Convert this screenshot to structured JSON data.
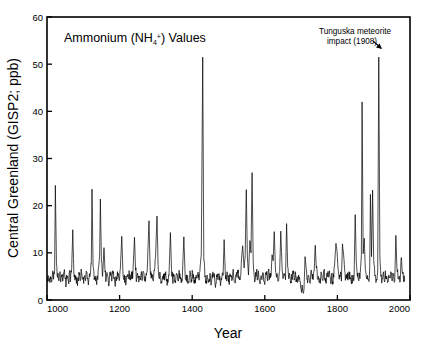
{
  "figure": {
    "background": "#ffffff",
    "line_color": "#000000"
  },
  "chart_data": {
    "type": "line",
    "title": "Ammonium (NH4+) Values",
    "title_parts": {
      "lead": "Ammonium (NH",
      "sub": "4",
      "sup": "+",
      "tail": ") Values"
    },
    "xlabel": "Year",
    "ylabel": "Central Greenland (GISP2; ppb)",
    "xlim": [
      1000,
      2000
    ],
    "ylim": [
      0,
      60
    ],
    "xticks": [
      1000,
      1200,
      1400,
      1600,
      1800,
      2000
    ],
    "xticklabels": [
      "1000",
      "1200",
      "1400",
      "1600",
      "1800",
      "2000"
    ],
    "yticks": [
      0,
      10,
      20,
      30,
      40,
      50,
      60
    ],
    "yticklabels": [
      "0",
      "10",
      "20",
      "30",
      "40",
      "50",
      "60"
    ],
    "grid": false,
    "legend": null,
    "series_name": "Ammonium (NH4+) concentration",
    "annotations": [
      {
        "text_line1": "Tunguska meteorite",
        "text_line2": "impact (1908)",
        "target_x": 1908,
        "target_y": 51.5,
        "arrow": "down-right-arrow"
      }
    ],
    "notable_peaks": [
      {
        "x": 1429,
        "y": 51.5
      },
      {
        "x": 1908,
        "y": 51.5
      },
      {
        "x": 1863,
        "y": 42.0
      },
      {
        "x": 1559,
        "y": 27.0
      },
      {
        "x": 1023,
        "y": 24.3
      },
      {
        "x": 1124,
        "y": 23.5
      },
      {
        "x": 1543,
        "y": 23.4
      },
      {
        "x": 1891,
        "y": 23.3
      },
      {
        "x": 1886,
        "y": 22.4
      },
      {
        "x": 1147,
        "y": 21.4
      },
      {
        "x": 1843,
        "y": 18.1
      },
      {
        "x": 1303,
        "y": 17.8
      },
      {
        "x": 1281,
        "y": 16.8
      },
      {
        "x": 1651,
        "y": 16.2
      },
      {
        "x": 1071,
        "y": 14.9
      },
      {
        "x": 1635,
        "y": 14.6
      },
      {
        "x": 1617,
        "y": 14.5
      },
      {
        "x": 1340,
        "y": 14.3
      },
      {
        "x": 1955,
        "y": 13.7
      },
      {
        "x": 1206,
        "y": 13.5
      },
      {
        "x": 1377,
        "y": 13.4
      },
      {
        "x": 1241,
        "y": 13.3
      },
      {
        "x": 1868,
        "y": 13.1
      },
      {
        "x": 1485,
        "y": 12.8
      },
      {
        "x": 1796,
        "y": 12.0
      },
      {
        "x": 1733,
        "y": 11.6
      },
      {
        "x": 1157,
        "y": 11.1
      },
      {
        "x": 1551,
        "y": 10.0
      }
    ],
    "baseline_mean": 4.5,
    "baseline_range": [
      2.0,
      7.5
    ],
    "x": [
      1000,
      1003,
      1006,
      1009,
      1012,
      1015,
      1018,
      1021,
      1023,
      1026,
      1029,
      1032,
      1035,
      1038,
      1041,
      1044,
      1047,
      1050,
      1053,
      1056,
      1059,
      1062,
      1065,
      1068,
      1071,
      1074,
      1077,
      1080,
      1083,
      1086,
      1089,
      1092,
      1095,
      1098,
      1101,
      1104,
      1107,
      1110,
      1113,
      1116,
      1119,
      1122,
      1124,
      1127,
      1130,
      1133,
      1136,
      1139,
      1142,
      1145,
      1147,
      1150,
      1153,
      1157,
      1160,
      1163,
      1166,
      1169,
      1172,
      1175,
      1178,
      1181,
      1184,
      1187,
      1190,
      1193,
      1196,
      1199,
      1202,
      1206,
      1209,
      1212,
      1215,
      1218,
      1221,
      1224,
      1227,
      1230,
      1233,
      1236,
      1241,
      1244,
      1247,
      1250,
      1253,
      1256,
      1259,
      1262,
      1265,
      1268,
      1271,
      1274,
      1277,
      1281,
      1284,
      1287,
      1290,
      1293,
      1296,
      1299,
      1303,
      1306,
      1309,
      1312,
      1315,
      1318,
      1321,
      1324,
      1327,
      1330,
      1333,
      1336,
      1340,
      1343,
      1346,
      1349,
      1352,
      1355,
      1358,
      1361,
      1364,
      1367,
      1370,
      1373,
      1377,
      1380,
      1383,
      1386,
      1389,
      1392,
      1395,
      1398,
      1401,
      1404,
      1407,
      1410,
      1413,
      1416,
      1419,
      1422,
      1425,
      1429,
      1432,
      1435,
      1438,
      1441,
      1444,
      1447,
      1450,
      1453,
      1456,
      1459,
      1462,
      1465,
      1468,
      1471,
      1474,
      1477,
      1480,
      1485,
      1488,
      1491,
      1494,
      1497,
      1500,
      1503,
      1506,
      1509,
      1512,
      1515,
      1518,
      1521,
      1524,
      1527,
      1530,
      1533,
      1536,
      1539,
      1543,
      1546,
      1549,
      1552,
      1555,
      1559,
      1562,
      1565,
      1568,
      1571,
      1574,
      1577,
      1580,
      1583,
      1586,
      1589,
      1592,
      1595,
      1598,
      1601,
      1604,
      1607,
      1610,
      1613,
      1617,
      1620,
      1623,
      1626,
      1629,
      1632,
      1635,
      1638,
      1641,
      1644,
      1647,
      1651,
      1654,
      1657,
      1660,
      1663,
      1666,
      1669,
      1672,
      1675,
      1678,
      1681,
      1684,
      1687,
      1690,
      1693,
      1696,
      1699,
      1702,
      1705,
      1708,
      1711,
      1714,
      1717,
      1720,
      1723,
      1726,
      1729,
      1733,
      1736,
      1739,
      1742,
      1745,
      1748,
      1751,
      1754,
      1757,
      1760,
      1763,
      1766,
      1769,
      1772,
      1775,
      1778,
      1781,
      1784,
      1787,
      1790,
      1793,
      1796,
      1799,
      1802,
      1805,
      1808,
      1811,
      1814,
      1817,
      1820,
      1823,
      1826,
      1829,
      1832,
      1835,
      1838,
      1843,
      1846,
      1849,
      1852,
      1855,
      1858,
      1863,
      1866,
      1868,
      1871,
      1874,
      1877,
      1880,
      1883,
      1886,
      1889,
      1891,
      1894,
      1897,
      1900,
      1903,
      1908,
      1911,
      1914,
      1917,
      1920,
      1923,
      1926,
      1929,
      1932,
      1935,
      1938,
      1941,
      1944,
      1947,
      1950,
      1955,
      1958,
      1961,
      1964,
      1967,
      1970,
      1973,
      1976,
      1979,
      1982,
      1985
    ],
    "y": [
      4.6,
      5.2,
      4.2,
      5.0,
      3.9,
      5.4,
      4.4,
      6.3,
      24.3,
      7.8,
      4.8,
      4.1,
      5.6,
      3.8,
      4.9,
      4.3,
      6.0,
      4.5,
      3.6,
      5.1,
      4.0,
      5.8,
      4.4,
      6.6,
      14.9,
      5.7,
      4.2,
      5.0,
      3.7,
      4.6,
      5.3,
      4.1,
      6.1,
      4.4,
      3.5,
      5.2,
      4.7,
      5.9,
      4.0,
      4.8,
      5.4,
      7.6,
      23.5,
      6.9,
      4.3,
      5.1,
      3.9,
      4.6,
      6.8,
      9.3,
      21.4,
      8.1,
      5.0,
      11.1,
      5.9,
      4.3,
      5.5,
      3.8,
      4.7,
      5.2,
      4.0,
      6.2,
      4.5,
      3.6,
      5.0,
      4.4,
      5.7,
      4.1,
      6.5,
      13.5,
      6.2,
      4.3,
      5.1,
      3.7,
      4.9,
      4.5,
      5.8,
      4.2,
      6.0,
      4.6,
      13.3,
      6.3,
      4.4,
      5.2,
      3.8,
      4.7,
      5.5,
      4.1,
      6.1,
      4.5,
      3.9,
      5.3,
      8.2,
      16.8,
      7.1,
      4.6,
      5.4,
      4.0,
      6.2,
      9.0,
      17.8,
      7.4,
      4.8,
      5.1,
      3.9,
      4.6,
      5.5,
      4.2,
      6.0,
      4.4,
      3.7,
      5.2,
      14.3,
      6.5,
      4.3,
      5.0,
      3.8,
      4.7,
      5.4,
      4.1,
      6.3,
      4.5,
      3.6,
      5.1,
      13.4,
      6.4,
      4.2,
      5.3,
      3.9,
      4.8,
      5.6,
      4.3,
      6.1,
      4.4,
      3.5,
      5.0,
      4.6,
      5.9,
      4.2,
      7.2,
      9.5,
      51.5,
      8.4,
      4.9,
      4.1,
      5.3,
      3.7,
      4.5,
      5.1,
      3.9,
      4.7,
      5.4,
      4.2,
      3.5,
      4.9,
      4.3,
      5.6,
      4.0,
      4.6,
      5.2,
      12.8,
      6.1,
      4.4,
      5.0,
      3.8,
      4.7,
      5.3,
      4.1,
      6.0,
      4.5,
      3.6,
      5.2,
      4.8,
      6.4,
      4.3,
      5.0,
      8.9,
      11.5,
      6.8,
      9.4,
      23.4,
      9.1,
      5.3,
      12.6,
      10.0,
      27.0,
      8.2,
      5.1,
      4.4,
      6.0,
      4.2,
      5.5,
      3.8,
      4.9,
      4.3,
      5.7,
      4.0,
      4.6,
      5.3,
      4.1,
      6.2,
      4.5,
      5.0,
      9.6,
      8.3,
      14.5,
      7.2,
      4.8,
      5.4,
      4.1,
      6.1,
      14.6,
      8.0,
      4.9,
      5.2,
      4.3,
      16.2,
      7.0,
      4.5,
      5.1,
      3.9,
      4.8,
      5.5,
      4.2,
      6.0,
      4.4,
      3.7,
      5.3,
      4.6,
      2.5,
      2.1,
      1.8,
      2.3,
      9.2,
      6.5,
      4.4,
      5.2,
      3.9,
      4.8,
      5.6,
      4.3,
      6.1,
      11.6,
      6.8,
      4.5,
      5.0,
      3.8,
      4.7,
      5.4,
      4.1,
      6.3,
      4.6,
      3.5,
      5.1,
      4.9,
      6.2,
      4.3,
      5.0,
      3.9,
      4.8,
      8.4,
      12.0,
      10.3,
      6.5,
      4.4,
      5.2,
      4.0,
      11.9,
      9.7,
      6.3,
      4.7,
      5.5,
      4.2,
      6.0,
      4.5,
      3.8,
      5.3,
      4.9,
      18.1,
      8.2,
      5.0,
      4.3,
      5.8,
      9.6,
      42.0,
      9.8,
      13.1,
      6.4,
      4.6,
      5.2,
      4.1,
      6.9,
      22.4,
      9.2,
      23.3,
      8.6,
      5.1,
      4.4,
      5.9,
      51.5,
      9.4,
      5.0,
      4.3,
      5.6,
      4.1,
      6.2,
      4.5,
      3.7,
      5.2,
      4.8,
      6.0,
      4.2,
      5.4,
      4.0,
      13.7,
      6.7,
      4.5,
      5.1,
      3.9,
      9.0,
      5.6,
      4.3,
      6.1,
      4.6,
      4.0
    ]
  }
}
